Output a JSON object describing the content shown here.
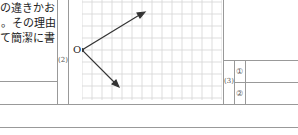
{
  "question_text": {
    "lines": [
      "の違きかお",
      "。その理由",
      "て簡潔に書"
    ]
  },
  "part2": {
    "label": "(2)",
    "origin_label": "O",
    "grid": {
      "cols": 14,
      "rows": 8,
      "cell_px": 10
    },
    "vectors": [
      {
        "name": "upper-vector",
        "from": [
          0,
          0
        ],
        "to": [
          5,
          3
        ]
      },
      {
        "name": "lower-vector",
        "from": [
          0,
          0
        ],
        "to": [
          3,
          -3
        ]
      }
    ]
  },
  "part3": {
    "label": "(3)",
    "items": [
      "①",
      "②"
    ]
  }
}
